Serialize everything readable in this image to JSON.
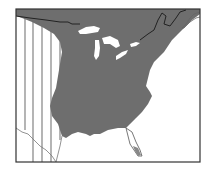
{
  "map": {
    "title": "Range map, eastern North America",
    "colors": {
      "range_fill": "#6e6e6e",
      "background": "#ffffff",
      "lakes": "#ffffff",
      "frame": "#333333",
      "borders": "#222222",
      "hatch": "#777777"
    },
    "legend_hidden": {
      "solid": "Primary range",
      "hatched": "Peripheral range"
    }
  }
}
